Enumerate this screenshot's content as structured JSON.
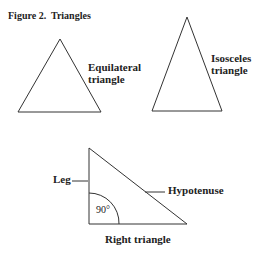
{
  "figure": {
    "title": "Figure 2.  Triangles",
    "equilateral": {
      "line1": "Equilateral",
      "line2": "triangle"
    },
    "isosceles": {
      "line1": "Isosceles",
      "line2": "triangle"
    },
    "right": {
      "caption": "Right triangle",
      "leg_label": "Leg",
      "hypotenuse_label": "Hypotenuse",
      "angle_label": "90°"
    }
  }
}
